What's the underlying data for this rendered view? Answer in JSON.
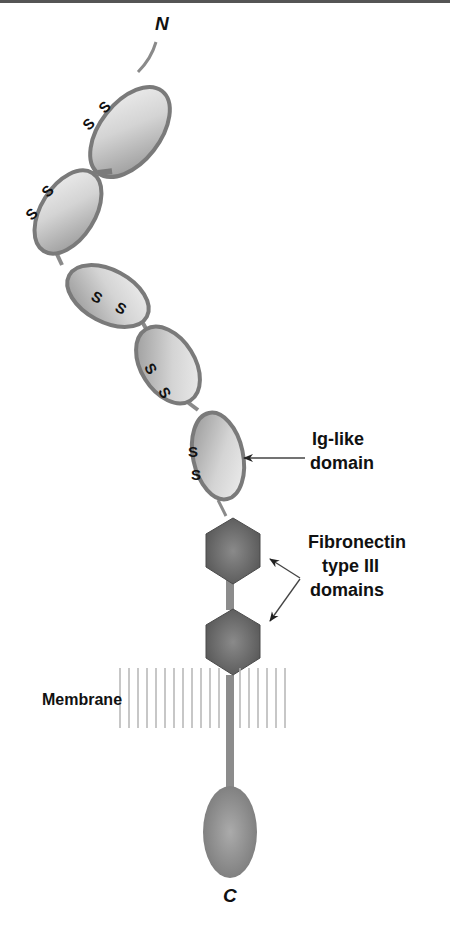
{
  "colors": {
    "background": "#ffffff",
    "top_rule": "#555555",
    "ig_fill_light": "#eeeeee",
    "ig_fill_dark": "#8f8f8f",
    "ig_outline": "#7a7a7a",
    "fn_fill_center": "#8a8a8a",
    "fn_fill_edge": "#555555",
    "stalk": "#8c8c8c",
    "membrane_line": "#b5b5b5",
    "cyto_fill_center": "#a8a8a8",
    "cyto_fill_edge": "#777777",
    "arrow": "#444444",
    "text": "#111111"
  },
  "termini": {
    "n_label": "N",
    "c_label": "C"
  },
  "ig_domains": [
    {
      "id": 1,
      "disulfide": [
        "S",
        "S"
      ]
    },
    {
      "id": 2,
      "disulfide": [
        "S",
        "S"
      ]
    },
    {
      "id": 3,
      "disulfide": [
        "S",
        "S"
      ]
    },
    {
      "id": 4,
      "disulfide": [
        "S",
        "S"
      ]
    },
    {
      "id": 5,
      "disulfide": [
        "S",
        "S"
      ]
    }
  ],
  "fibronectin_domains": [
    {
      "id": 1
    },
    {
      "id": 2
    }
  ],
  "labels": {
    "ig_like_line1": "Ig-like",
    "ig_like_line2": "domain",
    "fn_line1": "Fibronectin",
    "fn_line2": "type III",
    "fn_line3": "domains",
    "membrane": "Membrane"
  }
}
